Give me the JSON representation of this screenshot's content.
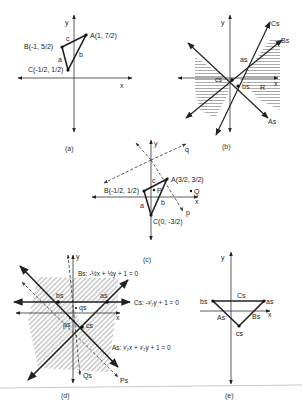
{
  "figure": {
    "panels": [
      {
        "id": "a",
        "caption": "(a)",
        "axes": {
          "x": "x",
          "y": "y"
        },
        "points": [
          {
            "name": "A",
            "label": "A(1, 7/2)",
            "coords": [
              1,
              3.5
            ]
          },
          {
            "name": "B",
            "label": "B(-1, 5/2)",
            "coords": [
              -1,
              2.5
            ]
          },
          {
            "name": "C",
            "label": "C(-1/2, 1/2)",
            "coords": [
              -0.5,
              0.5
            ]
          }
        ],
        "sides": [
          "a",
          "b",
          "c"
        ]
      },
      {
        "id": "b",
        "caption": "(b)",
        "axes": {
          "x": "x",
          "y": "y"
        },
        "lines": [
          "As",
          "Bs",
          "Cs"
        ],
        "labels": [
          "as",
          "bs",
          "cs",
          "R"
        ],
        "shaded_region": "R"
      },
      {
        "id": "c",
        "caption": "(c)",
        "axes": {
          "x": "x",
          "y": "y"
        },
        "points": [
          {
            "name": "A",
            "label": "A(3/2, 3/2)",
            "coords": [
              1.5,
              1.5
            ]
          },
          {
            "name": "B",
            "label": "B(-1/2, 1/2)",
            "coords": [
              -0.5,
              0.5
            ]
          },
          {
            "name": "C",
            "label": "C(0, -3/2)",
            "coords": [
              0,
              -1.5
            ]
          },
          {
            "name": "P",
            "label": "P"
          },
          {
            "name": "Q",
            "label": "Q"
          }
        ],
        "sides": [
          "a",
          "b",
          "c"
        ],
        "dashed_rays": [
          "p",
          "q"
        ]
      },
      {
        "id": "d",
        "caption": "(d)",
        "axes": {
          "x": "x",
          "y": "y"
        },
        "equations": {
          "Bs": "Bs: -1/2 x + 1/2 y + 1 = 0",
          "Cs": "Cs: -3/2 y + 1 = 0",
          "As": "As: 3/2 x + 3/2 y + 1 = 0"
        },
        "labels": [
          "as",
          "bs",
          "cs",
          "ps",
          "qs",
          "Ps",
          "Qs"
        ]
      },
      {
        "id": "e",
        "caption": "(e)",
        "axes": {
          "x": "x",
          "y": "y"
        },
        "vertices": [
          "as",
          "bs",
          "cs"
        ],
        "sides": [
          "As",
          "Bs",
          "Cs"
        ]
      }
    ]
  },
  "text": {
    "y": "y",
    "x": "x",
    "cap_a": "(a)",
    "cap_b": "(b)",
    "cap_c": "(c)",
    "cap_d": "(d)",
    "cap_e": "(e)",
    "A_a": "A(1, 7/2)",
    "B_a": "B(-1, 5/2)",
    "C_a": "C(-1/2, 1/2)",
    "A_c": "A(3/2, 3/2)",
    "B_c": "B(-1/2, 1/2)",
    "C_c": "C(0, -3/2)",
    "a": "a",
    "b": "b",
    "c": "c",
    "p": "p",
    "q": "q",
    "P": "P",
    "Q": "Q",
    "As": "As",
    "Bs": "Bs",
    "Cs": "Cs",
    "as": "as",
    "bs": "bs",
    "cs": "cs",
    "ps": "ps",
    "qs": "qs",
    "Ps": "Ps",
    "Qs": "Qs",
    "R": "R",
    "eq_Bs": "Bs: -½x + ½y + 1 = 0",
    "eq_Cs": "Cs: -³⁄₂y + 1 = 0",
    "eq_As": "As: ³⁄₂x + ³⁄₂y + 1 = 0"
  }
}
